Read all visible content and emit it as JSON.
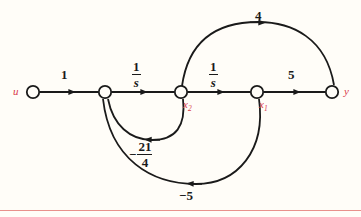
{
  "figure": {
    "kind": "signal-flow-graph",
    "background_color": "#fffdf8",
    "edge_color": "#1a1a1a",
    "node_label_color": "#d9394a",
    "rule_color": "#e8918c"
  },
  "nodes": [
    {
      "id": "u",
      "label": "u",
      "sub": "",
      "x": 33,
      "y": 92,
      "label_x": 14,
      "label_y": 87
    },
    {
      "id": "n2",
      "label": "",
      "sub": "",
      "x": 105,
      "y": 92,
      "label_x": 0,
      "label_y": 0
    },
    {
      "id": "x2",
      "label": "x",
      "sub": "2",
      "x": 181,
      "y": 92,
      "label_x": 182,
      "label_y": 99
    },
    {
      "id": "x1",
      "label": "x",
      "sub": "1",
      "x": 257,
      "y": 92,
      "label_x": 258,
      "label_y": 99
    },
    {
      "id": "y",
      "label": "y",
      "sub": "",
      "x": 332,
      "y": 92,
      "label_x": 345,
      "label_y": 87
    }
  ],
  "edges": [
    {
      "from": "u",
      "to": "n2",
      "gain": "1",
      "type": "integer",
      "label_x": 63,
      "label_y": 70
    },
    {
      "from": "n2",
      "to": "x2",
      "gain": "1/s",
      "type": "fraction",
      "numerator": "1",
      "denominator": "s",
      "sign": "",
      "label_x": 134,
      "label_y": 62
    },
    {
      "from": "x2",
      "to": "x1",
      "gain": "1/s",
      "type": "fraction",
      "numerator": "1",
      "denominator": "s",
      "sign": "",
      "label_x": 211,
      "label_y": 62
    },
    {
      "from": "x1",
      "to": "y",
      "gain": "5",
      "type": "integer",
      "label_x": 289,
      "label_y": 70
    },
    {
      "from": "x2",
      "to": "y",
      "gain": "4",
      "type": "integer",
      "label_x": 254,
      "label_y": 10
    },
    {
      "from": "x2",
      "to": "n2",
      "gain": "-21/4",
      "type": "fraction",
      "numerator": "21",
      "denominator": "4",
      "sign": "−",
      "label_x": 131,
      "label_y": 139
    },
    {
      "from": "x1",
      "to": "n2",
      "gain": "-5",
      "type": "integer",
      "label_x": 179,
      "label_y": 189
    }
  ],
  "labels": {
    "gain_u_n2": "1",
    "gain_n2_x2_num": "1",
    "gain_n2_x2_den": "s",
    "gain_x2_x1_num": "1",
    "gain_x2_x1_den": "s",
    "gain_x1_y": "5",
    "gain_x2_y": "4",
    "gain_x2_n2_sign": "−",
    "gain_x2_n2_num": "21",
    "gain_x2_n2_den": "4",
    "gain_x1_n2": "−5",
    "node_u": "u",
    "node_x2_base": "x",
    "node_x2_sub": "2",
    "node_x1_base": "x",
    "node_x1_sub": "1",
    "node_y": "y"
  }
}
